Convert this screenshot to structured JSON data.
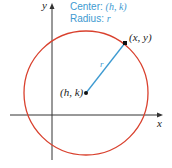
{
  "diagram": {
    "type": "circle-on-coordinate-plane",
    "legend": {
      "center_label": "Center: ",
      "center_value": "(h, k)",
      "radius_label": "Radius: ",
      "radius_value": "r"
    },
    "axes": {
      "x_label": "x",
      "y_label": "y"
    },
    "points": {
      "center": "(h, k)",
      "on_circle": "(x, y)"
    },
    "radius_segment_label": "r",
    "colors": {
      "circle": "#d9412e",
      "radius": "#3d9ad1",
      "legend_text": "#3d9ad1",
      "axes": "#333333",
      "points": "#111111"
    }
  }
}
